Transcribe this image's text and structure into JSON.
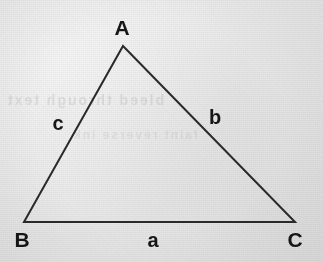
{
  "figure": {
    "kind": "geometry-diagram",
    "shape": "triangle",
    "width": 323,
    "height": 262,
    "background_color": "#e9e9e9",
    "ink_color": "#2a2a2a",
    "label_color": "#161616",
    "stroke_width": 2
  },
  "vertices": [
    {
      "id": "A",
      "label": "A",
      "x": 123,
      "y": 46,
      "label_x": 122,
      "label_y": 27
    },
    {
      "id": "B",
      "label": "B",
      "x": 24,
      "y": 222,
      "label_x": 22,
      "label_y": 239
    },
    {
      "id": "C",
      "label": "C",
      "x": 295,
      "y": 222,
      "label_x": 295,
      "label_y": 239
    }
  ],
  "sides": [
    {
      "id": "a",
      "label": "a",
      "opposite_vertex": "A",
      "from": "B",
      "to": "C",
      "label_x": 153,
      "label_y": 240
    },
    {
      "id": "b",
      "label": "b",
      "opposite_vertex": "B",
      "from": "A",
      "to": "C",
      "label_x": 215,
      "label_y": 117
    },
    {
      "id": "c",
      "label": "c",
      "opposite_vertex": "C",
      "from": "A",
      "to": "B",
      "label_x": 58,
      "label_y": 123
    }
  ],
  "paper": {
    "bleed_through_1": "bleed through text",
    "bleed_through_2": "faint reverse ink"
  }
}
